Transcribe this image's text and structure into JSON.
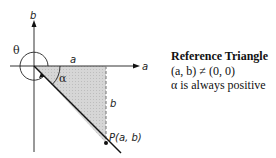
{
  "diagram": {
    "axes": {
      "x_label": "a",
      "y_label": "b"
    },
    "labels": {
      "theta": "θ",
      "alpha": "α",
      "side_a": "a",
      "side_b": "b",
      "point": "P(a, b)"
    },
    "colors": {
      "stroke": "#111111",
      "shade": "#d3d3d3",
      "dashed": "#888888"
    }
  },
  "caption": {
    "title": "Reference Triangle",
    "condition": "(a, b) ≠ (0, 0)",
    "note": "α is always positive"
  }
}
